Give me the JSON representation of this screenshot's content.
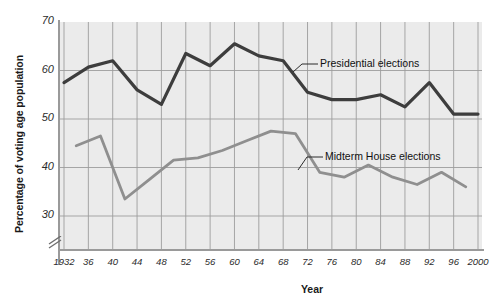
{
  "chart_data": {
    "type": "line",
    "title": "",
    "xlabel": "Year",
    "ylabel": "Percentage of voting age population",
    "ylim": [
      28,
      70
    ],
    "xlim": [
      1932,
      2000
    ],
    "grid": true,
    "axis_break": true,
    "legend_position": "inline-annotations",
    "y_ticks": [
      30,
      40,
      50,
      60,
      70
    ],
    "y_tick_labels": [
      "30",
      "40",
      "50",
      "60",
      "70"
    ],
    "x_ticks": [
      1932,
      1936,
      1940,
      1944,
      1948,
      1952,
      1956,
      1960,
      1964,
      1968,
      1972,
      1976,
      1980,
      1984,
      1988,
      1992,
      1996,
      2000
    ],
    "x_tick_labels": [
      "1932",
      "36",
      "40",
      "44",
      "48",
      "52",
      "56",
      "60",
      "64",
      "68",
      "72",
      "76",
      "80",
      "84",
      "88",
      "92",
      "96",
      "2000"
    ],
    "series": [
      {
        "name": "Presidential elections",
        "color": "#3d3d3d",
        "x": [
          1932,
          1936,
          1940,
          1944,
          1948,
          1952,
          1956,
          1960,
          1964,
          1968,
          1972,
          1976,
          1980,
          1984,
          1988,
          1992,
          1996,
          2000
        ],
        "values": [
          57.5,
          60.7,
          62.0,
          56.0,
          53.0,
          63.5,
          61.0,
          65.5,
          63.0,
          62.0,
          55.5,
          54.0,
          54.0,
          55.0,
          52.5,
          57.5,
          51.0,
          51.0
        ]
      },
      {
        "name": "Midterm House elections",
        "color": "#8f8f8f",
        "x": [
          1934,
          1938,
          1942,
          1946,
          1950,
          1954,
          1958,
          1962,
          1966,
          1970,
          1974,
          1978,
          1982,
          1986,
          1990,
          1994,
          1998
        ],
        "values": [
          44.5,
          46.5,
          33.5,
          37.5,
          41.5,
          42.0,
          43.5,
          45.5,
          47.5,
          47.0,
          39.0,
          38.0,
          40.5,
          38.0,
          36.5,
          39.0,
          36.0
        ]
      }
    ],
    "annotations": [
      {
        "text": "Presidential elections",
        "series": "Presidential elections"
      },
      {
        "text": "Midterm House elections",
        "series": "Midterm House elections"
      }
    ]
  }
}
